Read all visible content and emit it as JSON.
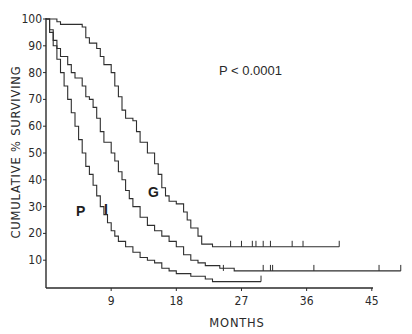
{
  "chart_data": {
    "type": "line",
    "subtype": "kaplan-meier-step",
    "title": "",
    "xlabel": "MONTHS",
    "ylabel": "CUMULATIVE % SURVIVING",
    "xlim": [
      0,
      45
    ],
    "ylim": [
      0,
      100
    ],
    "x_ticks": [
      9,
      18,
      27,
      36,
      45
    ],
    "y_ticks": [
      10,
      20,
      30,
      40,
      50,
      60,
      70,
      80,
      90,
      100
    ],
    "grid": false,
    "legend": "none (curves labeled inline)",
    "annotation": "P < 0.0001",
    "series": [
      {
        "name": "G",
        "points": [
          [
            0,
            100
          ],
          [
            1,
            100
          ],
          [
            1.5,
            99
          ],
          [
            2,
            98
          ],
          [
            3.5,
            98
          ],
          [
            5,
            97
          ],
          [
            5.5,
            93
          ],
          [
            6,
            91
          ],
          [
            7,
            89
          ],
          [
            7.5,
            86
          ],
          [
            8,
            83
          ],
          [
            9,
            80
          ],
          [
            9.5,
            75
          ],
          [
            10,
            71
          ],
          [
            10.5,
            66
          ],
          [
            11,
            63
          ],
          [
            12,
            62
          ],
          [
            12.5,
            58
          ],
          [
            13,
            54
          ],
          [
            14,
            50
          ],
          [
            15,
            46
          ],
          [
            15.5,
            42
          ],
          [
            16,
            37
          ],
          [
            16.5,
            34
          ],
          [
            17,
            32
          ],
          [
            18,
            31
          ],
          [
            19,
            28
          ],
          [
            19.5,
            25
          ],
          [
            20,
            22
          ],
          [
            21,
            19
          ],
          [
            21.5,
            16
          ],
          [
            22.5,
            16
          ],
          [
            23,
            15
          ],
          [
            40.5,
            15
          ]
        ],
        "censored_months": [
          25.5,
          27,
          28.5,
          29,
          30,
          31,
          34,
          35.5,
          40.5
        ]
      },
      {
        "name": "I",
        "points": [
          [
            0,
            100
          ],
          [
            0.5,
            96
          ],
          [
            1,
            92
          ],
          [
            1.5,
            89
          ],
          [
            2,
            86
          ],
          [
            3,
            83
          ],
          [
            3.5,
            80
          ],
          [
            4,
            78
          ],
          [
            5,
            75
          ],
          [
            5.5,
            71
          ],
          [
            6,
            70
          ],
          [
            6.5,
            67
          ],
          [
            7,
            63
          ],
          [
            7.5,
            58
          ],
          [
            8,
            54
          ],
          [
            9,
            50
          ],
          [
            9.5,
            47
          ],
          [
            10,
            43
          ],
          [
            10.5,
            40
          ],
          [
            11,
            36
          ],
          [
            11.5,
            33
          ],
          [
            12,
            30
          ],
          [
            13,
            26
          ],
          [
            14,
            23
          ],
          [
            15,
            21
          ],
          [
            16,
            19
          ],
          [
            17,
            17
          ],
          [
            18,
            15
          ],
          [
            19,
            12
          ],
          [
            20,
            10
          ],
          [
            21,
            9
          ],
          [
            22,
            8
          ],
          [
            24,
            7
          ],
          [
            26,
            6
          ],
          [
            49,
            6
          ]
        ],
        "censored_months": [
          24.5,
          30,
          31,
          31.3,
          37,
          46,
          49
        ]
      },
      {
        "name": "P",
        "points": [
          [
            0,
            100
          ],
          [
            0.5,
            95
          ],
          [
            1,
            90
          ],
          [
            1.5,
            85
          ],
          [
            2,
            80
          ],
          [
            2.5,
            75
          ],
          [
            3,
            70
          ],
          [
            3.5,
            65
          ],
          [
            4,
            60
          ],
          [
            4.5,
            55
          ],
          [
            5,
            50
          ],
          [
            5.5,
            45
          ],
          [
            6,
            42
          ],
          [
            6.5,
            38
          ],
          [
            7,
            34
          ],
          [
            7.5,
            30
          ],
          [
            8,
            27
          ],
          [
            8.5,
            24
          ],
          [
            9,
            21
          ],
          [
            9.5,
            19
          ],
          [
            10,
            17
          ],
          [
            11,
            15
          ],
          [
            12,
            13
          ],
          [
            13,
            11
          ],
          [
            14,
            10
          ],
          [
            15,
            9
          ],
          [
            16,
            7
          ],
          [
            17,
            6
          ],
          [
            18,
            5
          ],
          [
            19,
            5
          ],
          [
            20,
            4
          ],
          [
            22,
            3
          ],
          [
            23,
            2
          ],
          [
            29.7,
            2
          ]
        ],
        "censored_months": [
          29.7
        ]
      }
    ]
  },
  "labels": {
    "p_value": "P < 0.0001",
    "x_axis": "MONTHS",
    "y_axis": "CUMULATIVE % SURVIVING",
    "curve_g": "G",
    "curve_i": "I",
    "curve_p": "P"
  }
}
